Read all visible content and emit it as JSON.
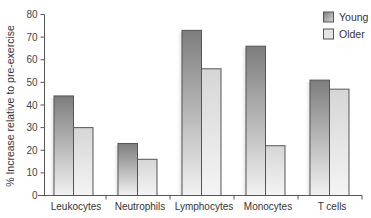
{
  "chart_data": {
    "type": "bar",
    "title": "",
    "xlabel": "",
    "ylabel": "% Increase relative to pre-exercise",
    "ylim": [
      0,
      80
    ],
    "yticks": [
      0,
      10,
      20,
      30,
      40,
      50,
      60,
      70,
      80
    ],
    "grid": false,
    "legend_position": "top-right",
    "categories": [
      "Leukocytes",
      "Neutrophils",
      "Lymphocytes",
      "Monocytes",
      "T cells"
    ],
    "series": [
      {
        "name": "Young",
        "color": "#8a8a8a",
        "values": [
          44,
          23,
          73,
          66,
          51
        ]
      },
      {
        "name": "Older",
        "color": "#e2e2e2",
        "values": [
          30,
          16,
          56,
          22,
          47
        ]
      }
    ]
  },
  "legend": {
    "items": [
      {
        "label": "Young"
      },
      {
        "label": "Older"
      }
    ]
  }
}
